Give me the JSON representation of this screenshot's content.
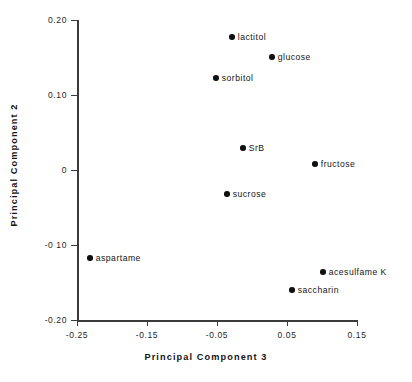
{
  "chart_data": {
    "type": "scatter",
    "title": "",
    "xlabel": "Principal  Component  3",
    "ylabel": "Principal  Component  2",
    "xlim": [
      -0.28,
      0.17
    ],
    "ylim": [
      -0.21,
      0.21
    ],
    "grid": false,
    "legend": "none",
    "xticks": [
      {
        "value": -0.25,
        "label": "-0.25",
        "px": 77
      },
      {
        "value": -0.15,
        "label": "-0.15",
        "px": 147
      },
      {
        "value": -0.05,
        "label": "-0.05",
        "px": 217
      },
      {
        "value": 0.05,
        "label": "0.05",
        "px": 287
      },
      {
        "value": 0.15,
        "label": "0.15",
        "px": 357
      }
    ],
    "yticks": [
      {
        "value": 0.2,
        "label": "0.20",
        "px": 20
      },
      {
        "value": 0.1,
        "label": "0.10",
        "px": 95
      },
      {
        "value": 0.0,
        "label": "0",
        "px": 170
      },
      {
        "value": -0.1,
        "label": "-0 10",
        "px": 245
      },
      {
        "value": -0.2,
        "label": "-0.20",
        "px": 320
      }
    ],
    "points": [
      {
        "name": "lactitol",
        "x": -0.029,
        "y": 0.177,
        "px": 232,
        "py": 37,
        "label_side": "right"
      },
      {
        "name": "glucose",
        "x": 0.029,
        "y": 0.151,
        "px": 272,
        "py": 57,
        "label_side": "right"
      },
      {
        "name": "sorbitol",
        "x": -0.051,
        "y": 0.123,
        "px": 216,
        "py": 78,
        "label_side": "right"
      },
      {
        "name": "SrB",
        "x": -0.013,
        "y": 0.029,
        "px": 243,
        "py": 148,
        "label_side": "right"
      },
      {
        "name": "fructose",
        "x": 0.09,
        "y": 0.008,
        "px": 315,
        "py": 164,
        "label_side": "right"
      },
      {
        "name": "sucrose",
        "x": -0.036,
        "y": -0.032,
        "px": 227,
        "py": 194,
        "label_side": "right"
      },
      {
        "name": "aspartame",
        "x": -0.231,
        "y": -0.117,
        "px": 90,
        "py": 258,
        "label_side": "right"
      },
      {
        "name": "acesulfame  K",
        "x": 0.101,
        "y": -0.136,
        "px": 323,
        "py": 272,
        "label_side": "right"
      },
      {
        "name": "saccharin",
        "x": 0.057,
        "y": -0.16,
        "px": 292,
        "py": 290,
        "label_side": "right"
      }
    ]
  }
}
